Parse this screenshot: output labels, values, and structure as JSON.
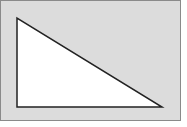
{
  "diagram": {
    "shape": "right-triangle",
    "panel": {
      "x": 0,
      "y": 0,
      "width": 181,
      "height": 121,
      "fill": "#dcdcdc",
      "stroke": "#8a8a8a"
    },
    "triangle": {
      "vertices": [
        [
          17,
          18
        ],
        [
          17,
          107
        ],
        [
          162,
          107
        ]
      ],
      "fill": "#ffffff",
      "stroke": "#222222",
      "stroke_width": 1.5
    }
  }
}
